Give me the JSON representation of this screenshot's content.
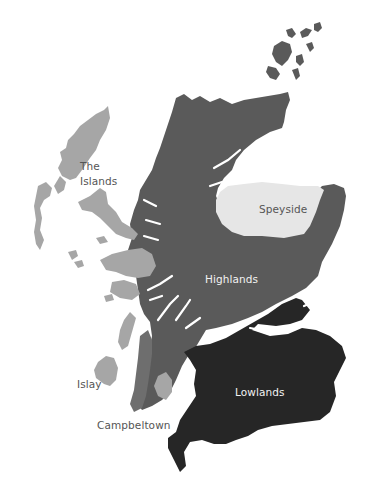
{
  "map": {
    "title": "Scotch whisky regions",
    "background": "#ffffff",
    "regions": [
      {
        "id": "highlands",
        "name": "Highlands",
        "color": "#5a5a5a"
      },
      {
        "id": "speyside",
        "name": "Speyside",
        "color": "#e6e6e6"
      },
      {
        "id": "lowlands",
        "name": "Lowlands",
        "color": "#262626"
      },
      {
        "id": "islands",
        "name": "The Islands",
        "color": "#a6a6a6"
      },
      {
        "id": "islay",
        "name": "Islay",
        "color": "#a6a6a6"
      },
      {
        "id": "campbeltown",
        "name": "Campbeltown",
        "color": "#6e6e6e"
      }
    ],
    "labels": {
      "islands_line1": "The",
      "islands_line2": "Islands",
      "speyside": "Speyside",
      "highlands": "Highlands",
      "islay": "Islay",
      "lowlands": "Lowlands",
      "campbeltown": "Campbeltown"
    }
  }
}
